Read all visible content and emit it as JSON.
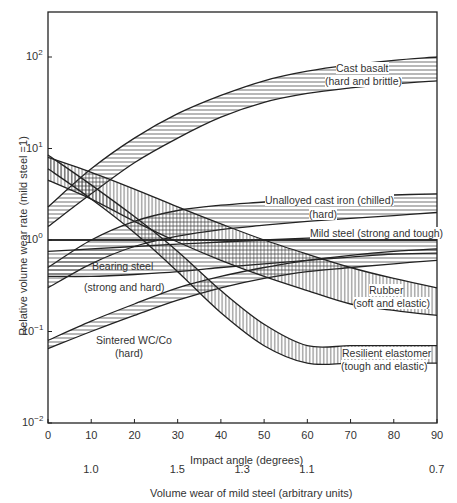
{
  "header": {
    "page_text": "..."
  },
  "chart_data": {
    "type": "area",
    "title": "",
    "xlabel": "Impact angle (degrees)",
    "secondary_xlabel": "Volume wear of mild steel (arbitrary units)",
    "ylabel": "Relative volume wear rate (mild steel =1)",
    "yscale": "log",
    "xlim": [
      0,
      90
    ],
    "ylim": [
      0.01,
      300
    ],
    "x_ticks": [
      "0",
      "10",
      "20",
      "30",
      "40",
      "50",
      "60",
      "70",
      "80",
      "90"
    ],
    "y_ticks": [
      "10^-2",
      "10^-1",
      "10^0",
      "10^1",
      "10^2"
    ],
    "secondary_x_ticks": [
      {
        "angle": 10,
        "label": "1.0"
      },
      {
        "angle": 30,
        "label": "1.5"
      },
      {
        "angle": 45,
        "label": "1.3"
      },
      {
        "angle": 60,
        "label": "1.1"
      },
      {
        "angle": 90,
        "label": "0.7"
      }
    ],
    "grid": false,
    "legend": "inline labels",
    "series": [
      {
        "name": "Cast basalt (hard and brittle)",
        "hatch": "horizontal",
        "x": [
          0,
          10,
          20,
          30,
          40,
          50,
          60,
          70,
          80,
          90
        ],
        "lower": [
          1.4,
          3.2,
          7,
          13,
          22,
          32,
          40,
          46,
          51,
          55
        ],
        "upper": [
          2.3,
          6,
          13,
          24,
          38,
          55,
          70,
          82,
          92,
          100
        ]
      },
      {
        "name": "Unalloyed cast iron (chilled) (hard)",
        "hatch": "horizontal",
        "x": [
          0,
          10,
          20,
          30,
          40,
          50,
          60,
          70,
          80,
          90
        ],
        "lower": [
          0.3,
          0.55,
          0.85,
          1.1,
          1.3,
          1.45,
          1.6,
          1.72,
          1.85,
          2.0
        ],
        "upper": [
          0.5,
          1.0,
          1.6,
          2.1,
          2.4,
          2.6,
          2.8,
          2.95,
          3.1,
          3.2
        ]
      },
      {
        "name": "Mild steel (strong and tough)",
        "hatch": "none",
        "x": [
          0,
          10,
          20,
          30,
          40,
          50,
          60,
          70,
          80,
          90
        ],
        "lower": [
          1.0,
          1.0,
          1.0,
          1.0,
          1.0,
          1.0,
          1.0,
          1.0,
          1.0,
          1.0
        ],
        "upper": [
          1.0,
          1.0,
          1.0,
          1.0,
          1.0,
          1.0,
          1.0,
          1.0,
          1.0,
          1.0
        ]
      },
      {
        "name": "Bearing steel (strong and hard)",
        "hatch": "horizontal",
        "x": [
          0,
          10,
          20,
          30,
          40,
          50,
          60,
          70,
          80,
          90
        ],
        "lower": [
          0.4,
          0.4,
          0.42,
          0.45,
          0.5,
          0.55,
          0.6,
          0.65,
          0.7,
          0.72
        ],
        "upper": [
          0.75,
          0.8,
          0.85,
          0.9,
          0.95,
          1.0,
          1.05,
          1.1,
          1.2,
          1.3
        ]
      },
      {
        "name": "Sintered WC/Co (hard)",
        "hatch": "horizontal",
        "x": [
          0,
          10,
          20,
          30,
          40,
          50,
          60,
          70,
          80,
          90
        ],
        "lower": [
          0.065,
          0.1,
          0.15,
          0.22,
          0.3,
          0.38,
          0.45,
          0.5,
          0.55,
          0.6
        ],
        "upper": [
          0.08,
          0.13,
          0.2,
          0.3,
          0.4,
          0.5,
          0.6,
          0.68,
          0.75,
          0.8
        ]
      },
      {
        "name": "Rubber (soft and elastic)",
        "hatch": "vertical",
        "x": [
          0,
          10,
          20,
          30,
          40,
          50,
          60,
          70,
          80,
          90
        ],
        "lower": [
          4.5,
          2.8,
          1.6,
          0.95,
          0.6,
          0.4,
          0.28,
          0.2,
          0.17,
          0.15
        ],
        "upper": [
          8,
          5.5,
          3.6,
          2.3,
          1.5,
          1.0,
          0.7,
          0.5,
          0.38,
          0.3
        ]
      },
      {
        "name": "Resilient elastomer (tough and elastic)",
        "hatch": "vertical",
        "x": [
          0,
          10,
          20,
          30,
          40,
          50,
          60,
          70,
          80,
          90
        ],
        "lower": [
          6,
          2.8,
          1.2,
          0.45,
          0.16,
          0.07,
          0.045,
          0.045,
          0.045,
          0.045
        ],
        "upper": [
          8.5,
          4,
          1.8,
          0.75,
          0.28,
          0.12,
          0.07,
          0.07,
          0.07,
          0.07
        ]
      }
    ]
  },
  "labels": {
    "cast_basalt_1": "Cast basalt",
    "cast_basalt_2": "(hard and brittle)",
    "cast_iron_1": "Unalloyed cast iron (chilled)",
    "cast_iron_2": "(hard)",
    "mild_steel": "Mild steel (strong and tough)",
    "bearing_steel_1": "Bearing steel",
    "bearing_steel_2": "(strong and hard)",
    "rubber_1": "Rubber",
    "rubber_2": "(soft and elastic)",
    "wcco_1": "Sintered WC/Co",
    "wcco_2": "(hard)",
    "elastomer_1": "Resilient elastomer",
    "elastomer_2": "(tough and elastic)"
  }
}
